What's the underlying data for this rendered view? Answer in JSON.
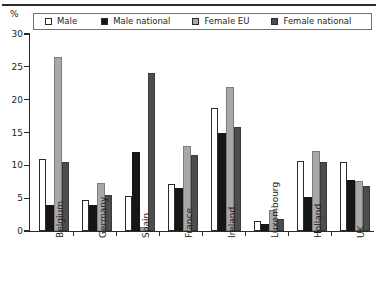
{
  "axis_title": "%",
  "legend": [
    {
      "label": "Male",
      "color": "#ffffff",
      "name": "male"
    },
    {
      "label": "Male national",
      "color": "#161616",
      "name": "male-national"
    },
    {
      "label": "Female EU",
      "color": "#a8a8a8",
      "name": "female-eu"
    },
    {
      "label": "Female national",
      "color": "#4d4d4d",
      "name": "female-national"
    }
  ],
  "y_ticks": [
    "0",
    "5",
    "10",
    "15",
    "20",
    "25",
    "30"
  ],
  "chart_data": {
    "type": "bar",
    "title": "",
    "xlabel": "",
    "ylabel": "%",
    "ylim": [
      0,
      30
    ],
    "ytick_step": 5,
    "grid": false,
    "legend_position": "top",
    "categories": [
      "Belgium",
      "Germany",
      "Spain",
      "France",
      "Ireland",
      "Luxembourg",
      "Holland",
      "UK"
    ],
    "series": [
      {
        "name": "Male",
        "color": "#ffffff",
        "values": [
          11.0,
          4.7,
          5.4,
          7.2,
          18.8,
          1.5,
          10.7,
          10.5
        ]
      },
      {
        "name": "Male national",
        "color": "#161616",
        "values": [
          4.0,
          3.9,
          12.0,
          6.5,
          15.0,
          1.1,
          5.2,
          7.8
        ]
      },
      {
        "name": "Female EU",
        "color": "#a8a8a8",
        "values": [
          26.5,
          7.3,
          0.6,
          13.0,
          22.0,
          3.2,
          12.2,
          7.6
        ]
      },
      {
        "name": "Female national",
        "color": "#4d4d4d",
        "values": [
          10.5,
          5.5,
          24.0,
          11.5,
          15.8,
          1.9,
          10.5,
          6.9
        ]
      }
    ]
  }
}
